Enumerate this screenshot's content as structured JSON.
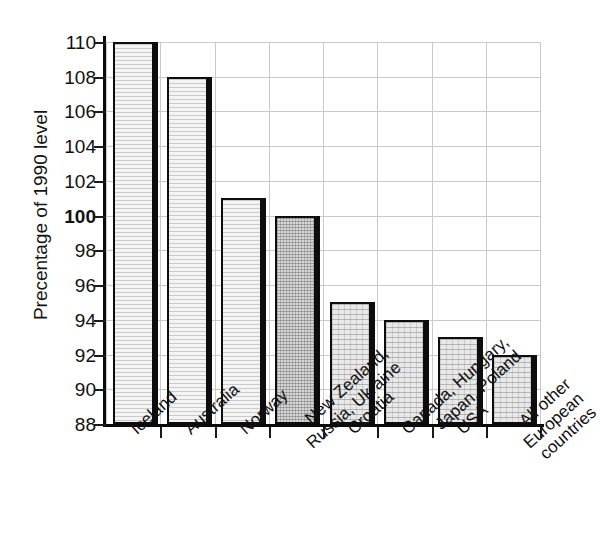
{
  "chart_data": {
    "type": "bar",
    "title": "",
    "subtitle": "",
    "xlabel": "",
    "ylabel": "Precentage of 1990 level",
    "ylim": [
      88,
      110
    ],
    "ytick_step": 2,
    "yticks": [
      88,
      90,
      92,
      94,
      96,
      98,
      100,
      102,
      104,
      106,
      108,
      110
    ],
    "ytick_labels": [
      "88",
      "90",
      "92",
      "94",
      "96",
      "98",
      "100",
      "102",
      "104",
      "106",
      "108",
      "110"
    ],
    "emphasized_ytick": "100",
    "grid": "both",
    "legend": "none",
    "bar_style": {
      "edge_color": "#0d0d0d",
      "shadow_color": "#0d0d0d",
      "fill_light": "#f4f4f4",
      "fill_mid": "#e8e8e8",
      "fill_dark": "#d6d6d6"
    },
    "categories": [
      "Iceland",
      "Australia",
      "Norway",
      "New Zealand, Russia, Ukraine",
      "Croatia",
      "Canada, Hungary, Japan, Poland",
      "USA",
      "All other European countries"
    ],
    "category_lines": [
      [
        "Iceland"
      ],
      [
        "Australia"
      ],
      [
        "Norway"
      ],
      [
        "New Zealand,",
        "Russia, Ukraine"
      ],
      [
        "Croatia"
      ],
      [
        "Canada, Hungary,",
        "Japan, Poland"
      ],
      [
        "USA"
      ],
      [
        "All other",
        "European",
        "countries"
      ]
    ],
    "values": [
      110,
      108,
      101,
      100,
      95,
      94,
      93,
      92
    ],
    "fills": [
      "light",
      "light",
      "light",
      "dark",
      "mid",
      "mid",
      "mid",
      "mid"
    ]
  }
}
